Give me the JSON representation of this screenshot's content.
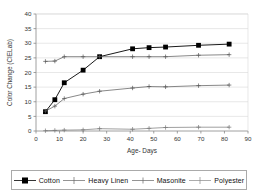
{
  "chart_data": {
    "type": "line",
    "title": "",
    "xlabel": "Age- Days",
    "ylabel": "Color Change (CIELab)",
    "xlim": [
      0,
      90
    ],
    "ylim": [
      0,
      40
    ],
    "xticks": [
      0,
      10,
      20,
      30,
      40,
      50,
      60,
      70,
      80,
      90
    ],
    "yticks": [
      0,
      5,
      10,
      15,
      20,
      25,
      30,
      35,
      40
    ],
    "grid": true,
    "legend_position": "bottom",
    "series": [
      {
        "name": "Cotton",
        "marker": "filled-square",
        "color": "#000000",
        "x": [
          4,
          8,
          12,
          20,
          27,
          41,
          48,
          55,
          69,
          82
        ],
        "y": [
          6.6,
          10.7,
          16.5,
          20.8,
          25.4,
          28.1,
          28.5,
          28.7,
          29.3,
          29.7
        ]
      },
      {
        "name": "Heavy Linen",
        "marker": "plus",
        "color": "#555555",
        "x": [
          4,
          8,
          12,
          20,
          27,
          41,
          48,
          55,
          69,
          82
        ],
        "y": [
          23.8,
          23.9,
          25.4,
          25.4,
          25.4,
          25.4,
          25.4,
          25.4,
          25.9,
          26.1
        ]
      },
      {
        "name": "Masonite",
        "marker": "plus",
        "color": "#555555",
        "x": [
          4,
          8,
          12,
          20,
          27,
          41,
          48,
          55,
          69,
          82
        ],
        "y": [
          6.8,
          8.5,
          11.1,
          12.6,
          13.6,
          14.7,
          15.2,
          15.1,
          15.5,
          15.7
        ]
      },
      {
        "name": "Polyester",
        "marker": "plus",
        "color": "#777777",
        "x": [
          4,
          8,
          12,
          20,
          27,
          41,
          48,
          55,
          69,
          82
        ],
        "y": [
          0.1,
          0.2,
          0.3,
          0.4,
          0.8,
          0.6,
          0.9,
          1.2,
          1.3,
          1.3
        ]
      }
    ]
  },
  "legend": {
    "items": [
      {
        "label": "Cotton",
        "marker": "filled-square"
      },
      {
        "label": "Heavy Linen",
        "marker": "plus"
      },
      {
        "label": "Masonite",
        "marker": "plus"
      },
      {
        "label": "Polyester",
        "marker": "plus"
      }
    ]
  }
}
